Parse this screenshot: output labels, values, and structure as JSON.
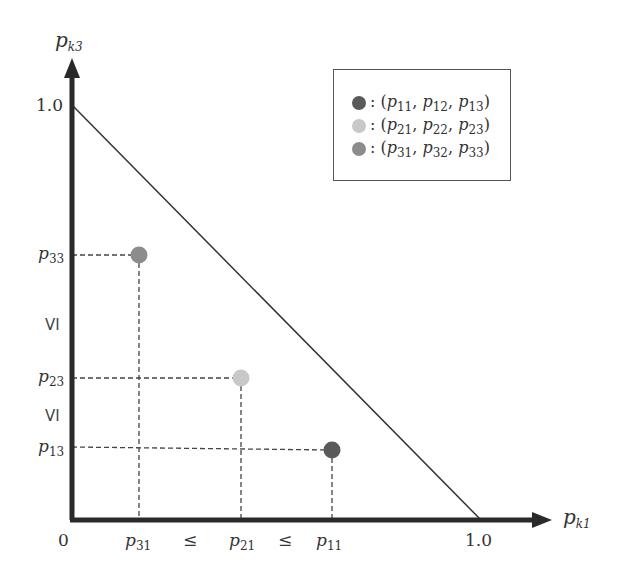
{
  "axes": {
    "y_label": {
      "base": "p",
      "sub": "k3"
    },
    "x_label": {
      "base": "p",
      "sub": "k1"
    },
    "origin": "0",
    "y_max_tick": "1.0",
    "x_max_tick": "1.0"
  },
  "y_ticks": [
    {
      "base": "p",
      "sub": "33"
    },
    {
      "base": "p",
      "sub": "23"
    },
    {
      "base": "p",
      "sub": "13"
    }
  ],
  "x_ticks": [
    {
      "base": "p",
      "sub": "31"
    },
    {
      "base": "p",
      "sub": "21"
    },
    {
      "base": "p",
      "sub": "11"
    }
  ],
  "relations": {
    "leq": "≤",
    "y_leq": "VI"
  },
  "legend": [
    {
      "label": ": (p11, p12, p13)",
      "color": "#5a5a5a",
      "subs": [
        "11",
        "12",
        "13"
      ]
    },
    {
      "label": ": (p21, p22, p23)",
      "color": "#c8c8c8",
      "subs": [
        "21",
        "22",
        "23"
      ]
    },
    {
      "label": ": (p31, p32, p33)",
      "color": "#8c8c8c",
      "subs": [
        "31",
        "32",
        "33"
      ]
    }
  ],
  "points": [
    {
      "name": "p1",
      "color": "#5a5a5a",
      "x": 332,
      "y": 450
    },
    {
      "name": "p2",
      "color": "#c8c8c8",
      "x": 241,
      "y": 378
    },
    {
      "name": "p3",
      "color": "#8c8c8c",
      "x": 139,
      "y": 255
    }
  ]
}
